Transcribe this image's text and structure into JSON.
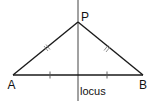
{
  "diagram": {
    "points": [
      {
        "id": "A",
        "label": "A",
        "x": 13,
        "y": 75
      },
      {
        "id": "B",
        "label": "B",
        "x": 143,
        "y": 75
      },
      {
        "id": "P",
        "label": "P",
        "x": 78,
        "y": 22
      }
    ],
    "locus_label": "locus",
    "line_color": "#1a1a1a",
    "tick_color": "#555555"
  }
}
